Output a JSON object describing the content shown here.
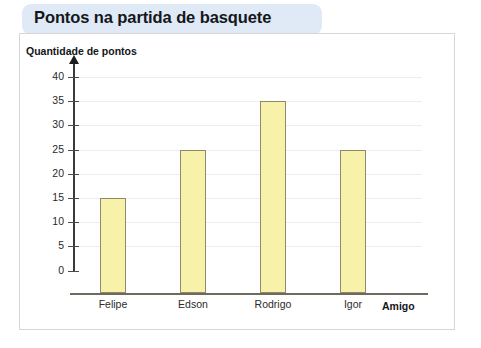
{
  "title": "Pontos na partida de basquete",
  "axis": {
    "y_title": "Quantidade de pontos",
    "x_title": "Amigo"
  },
  "colors": {
    "title_banner": "#dfeaf6",
    "bar_fill": "#f8f1a9",
    "bar_border": "#8e8a6a",
    "gridline": "#ededed",
    "frame_border": "#d7d7d7",
    "axis_line": "#3b3b3b"
  },
  "chart_data": {
    "type": "bar",
    "title": "Pontos na partida de basquete",
    "xlabel": "Amigo",
    "ylabel": "Quantidade de pontos",
    "categories": [
      "Felipe",
      "Edson",
      "Rodrigo",
      "Igor"
    ],
    "values": [
      15,
      25,
      35,
      25
    ],
    "ylim": [
      0,
      40
    ],
    "ytick_labels": [
      "40",
      "35",
      "30",
      "25",
      "20",
      "15",
      "10",
      "5",
      "0"
    ],
    "ytick_values": [
      40,
      35,
      30,
      25,
      20,
      15,
      10,
      5,
      0
    ],
    "ytick_step": 5,
    "grid": true,
    "legend": false
  }
}
